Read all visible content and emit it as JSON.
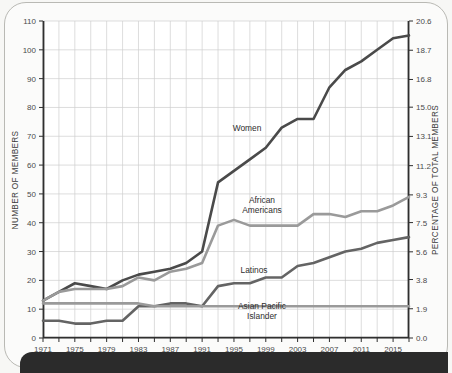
{
  "chart_data": {
    "type": "line",
    "title": "",
    "xlabel": "",
    "ylabel": "NUMBER OF MEMBERS",
    "y2label": "PERCENTAGE OF TOTAL MEMBERS",
    "grid": true,
    "legend_position": "inline-annotations",
    "xlim": [
      1971,
      2017
    ],
    "ylim": [
      0,
      110
    ],
    "y2lim": [
      0.0,
      20.6
    ],
    "xticks_major": [
      1971,
      1975,
      1979,
      1983,
      1987,
      1991,
      1995,
      1999,
      2003,
      2007,
      2011,
      2015
    ],
    "xticks_minor_step": 2,
    "yticks": [
      0,
      10,
      20,
      30,
      40,
      50,
      60,
      70,
      80,
      90,
      100,
      110
    ],
    "ytick_labels": [
      "0",
      "10",
      "20",
      "30",
      "40",
      "50",
      "60",
      "70",
      "80",
      "90",
      "100",
      "110"
    ],
    "y2ticks": [
      0.0,
      1.9,
      3.8,
      5.6,
      7.5,
      9.3,
      11.2,
      13.1,
      15.0,
      16.8,
      18.7,
      20.6
    ],
    "y2tick_labels": [
      "0.0",
      "1.9",
      "3.8",
      "5.6",
      "7.5",
      "9.3",
      "11.2",
      "13.1",
      "15.0",
      "16.8",
      "18.7",
      "20.6"
    ],
    "x": [
      1971,
      1973,
      1975,
      1977,
      1979,
      1981,
      1983,
      1985,
      1987,
      1989,
      1991,
      1993,
      1995,
      1997,
      1999,
      2001,
      2003,
      2005,
      2007,
      2009,
      2011,
      2013,
      2015,
      2017
    ],
    "series": [
      {
        "name": "Women",
        "color": "#4a4a4a",
        "label_text": "Women",
        "values": [
          13,
          16,
          19,
          18,
          17,
          20,
          22,
          23,
          24,
          26,
          30,
          54,
          58,
          62,
          66,
          73,
          76,
          76,
          87,
          93,
          96,
          100,
          104,
          105
        ]
      },
      {
        "name": "African Americans",
        "color": "#9a9a9a",
        "label_text": "African\nAmericans",
        "values": [
          13,
          16,
          17,
          17,
          17,
          18,
          21,
          20,
          23,
          24,
          26,
          39,
          41,
          39,
          39,
          39,
          39,
          43,
          43,
          42,
          44,
          44,
          46,
          49
        ]
      },
      {
        "name": "Latinos",
        "color": "#646464",
        "label_text": "Latinos",
        "values": [
          6,
          6,
          5,
          5,
          6,
          6,
          11,
          11,
          12,
          12,
          11,
          18,
          19,
          19,
          21,
          21,
          25,
          26,
          28,
          30,
          31,
          33,
          34,
          35
        ]
      },
      {
        "name": "Asian Pacific Islander",
        "color": "#9a9a9a",
        "label_text": "Asian Pacific\nIslander",
        "values": [
          12,
          12,
          12,
          12,
          12,
          12,
          12,
          11,
          11,
          11,
          11,
          11,
          11,
          11,
          11,
          11,
          11,
          11,
          11,
          11,
          11,
          11,
          11,
          11
        ]
      }
    ],
    "annotations": [
      {
        "name": "women-label",
        "text": "Women",
        "x": 247,
        "y": 131
      },
      {
        "name": "african-americans-label",
        "line1": "African",
        "line2": "Americans",
        "x": 262,
        "y": 203
      },
      {
        "name": "latinos-label",
        "text": "Latinos",
        "x": 254,
        "y": 273
      },
      {
        "name": "asian-pacific-islander-label",
        "line1": "Asian Pacific",
        "line2": "Islander",
        "x": 262,
        "y": 309
      }
    ]
  }
}
